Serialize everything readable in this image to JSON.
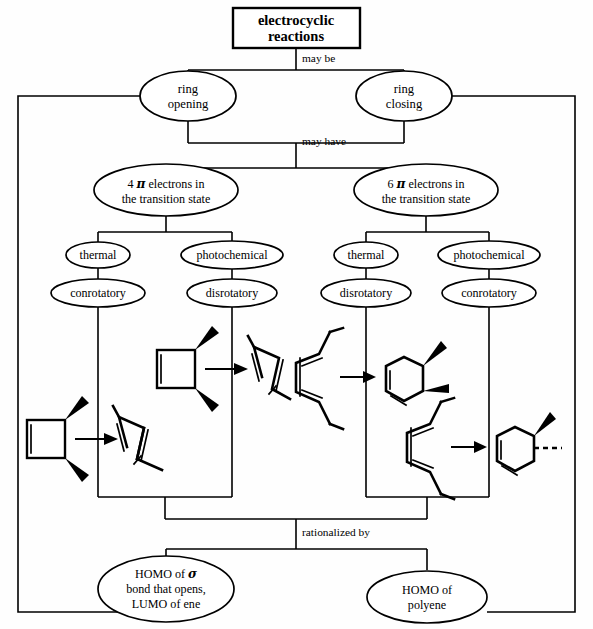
{
  "title_box": {
    "line1": "electrocyclic",
    "line2": "reactions"
  },
  "connectors": {
    "may_be": "may be",
    "may_have": "may have",
    "rationalized_by": "rationalized by"
  },
  "tier1": [
    {
      "id": "ring-opening",
      "line1": "ring",
      "line2": "opening"
    },
    {
      "id": "ring-closing",
      "line1": "ring",
      "line2": "closing"
    }
  ],
  "tier2": [
    {
      "id": "four-pi",
      "count": "4",
      "symbol": "π",
      "line1_tail": "electrons in",
      "line2": "the transition state"
    },
    {
      "id": "six-pi",
      "count": "6",
      "symbol": "π",
      "line1_tail": "electrons in",
      "line2": "the transition state"
    }
  ],
  "conditions": [
    {
      "id": "thermal-4pi",
      "label": "thermal"
    },
    {
      "id": "photochemical-4pi",
      "label": "photochemical"
    },
    {
      "id": "thermal-6pi",
      "label": "thermal"
    },
    {
      "id": "photochemical-6pi",
      "label": "photochemical"
    }
  ],
  "modes": [
    {
      "id": "conrotatory-4pi-thermal",
      "label": "conrotatory"
    },
    {
      "id": "disrotatory-4pi-photochemical",
      "label": "disrotatory"
    },
    {
      "id": "disrotatory-6pi-thermal",
      "label": "disrotatory"
    },
    {
      "id": "conrotatory-6pi-photochemical",
      "label": "conrotatory"
    }
  ],
  "bottom": [
    {
      "id": "homo-sigma",
      "line1_head": "HOMO of ",
      "line1_symbol": "σ",
      "line2": "bond that opens,",
      "line3": "LUMO of ene"
    },
    {
      "id": "homo-polyene",
      "line1": "HOMO of",
      "line2": "polyene"
    }
  ],
  "structures": [
    {
      "id": "cyclobutene-to-diene-conrotatory",
      "reactant": "cyclobutene with two bold wedge substituents",
      "product": "s-cis butadiene",
      "stereo": "conrotatory"
    },
    {
      "id": "cyclobutene-to-diene-disrotatory",
      "reactant": "cyclobutene with two bold wedge substituents",
      "product": "s-cis butadiene",
      "stereo": "disrotatory"
    },
    {
      "id": "triene-to-cyclohexadiene-disrotatory",
      "reactant": "hexatriene",
      "product": "cyclohexadiene with two bold wedges (cis)",
      "stereo": "disrotatory"
    },
    {
      "id": "triene-to-cyclohexadiene-conrotatory",
      "reactant": "hexatriene",
      "product": "cyclohexadiene with one wedge and one dashed bond (trans)",
      "stereo": "conrotatory"
    }
  ],
  "colors": {
    "ink": "#000000",
    "paper": "#fefefe"
  }
}
